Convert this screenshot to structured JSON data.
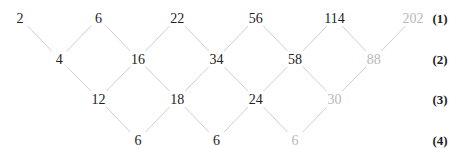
{
  "colors": {
    "text": "#222222",
    "muted_text": "#b8b8b8",
    "line": "#cfcfcf"
  },
  "rows": [
    {
      "label": "(1)",
      "values": [
        "2",
        "6",
        "22",
        "56",
        "114",
        "202"
      ],
      "muted": [
        false,
        false,
        false,
        false,
        false,
        true
      ]
    },
    {
      "label": "(2)",
      "values": [
        "4",
        "16",
        "34",
        "58",
        "88"
      ],
      "muted": [
        false,
        false,
        false,
        false,
        true
      ]
    },
    {
      "label": "(3)",
      "values": [
        "12",
        "18",
        "24",
        "30"
      ],
      "muted": [
        false,
        false,
        false,
        true
      ]
    },
    {
      "label": "(4)",
      "values": [
        "6",
        "6",
        "6"
      ],
      "muted": [
        false,
        false,
        true
      ]
    }
  ]
}
